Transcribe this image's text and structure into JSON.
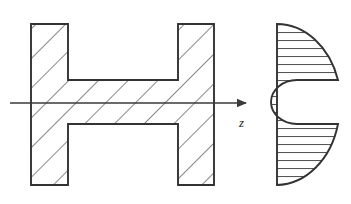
{
  "figure": {
    "background_color": "#ffffff",
    "line_color": "#333333",
    "hatch_color": "#555555",
    "axis_color": "#3a3a3a",
    "axis_label": "z",
    "axis_label_name": "z-axis-label",
    "views": [
      {
        "name": "longitudinal-section",
        "shape": "I-beam / H profile",
        "hatch_style": "diagonal-45",
        "hatch_spacing_px": 21
      },
      {
        "name": "cross-section",
        "shape": "half-disc with rectangular notch",
        "hatch_style": "horizontal",
        "hatch_spacing_px": 8
      }
    ],
    "geometry": {
      "h_profile": {
        "left_flange_x": 31,
        "left_flange_right_x": 68,
        "right_flange_x": 178,
        "right_flange_right_x": 214,
        "top_y": 24,
        "bottom_y": 185,
        "web_top_y": 80,
        "web_bottom_y": 124
      },
      "axis": {
        "start_x": 10,
        "end_x": 252,
        "y": 103
      },
      "cross_section": {
        "flat_edge_x": 277,
        "top_y": 24,
        "bottom_y": 185,
        "center_y": 104,
        "radius_x": 64,
        "notch_top_y": 80,
        "notch_bottom_y": 124,
        "notch_outer_x": 338,
        "notch_inner_x": 297
      }
    }
  }
}
